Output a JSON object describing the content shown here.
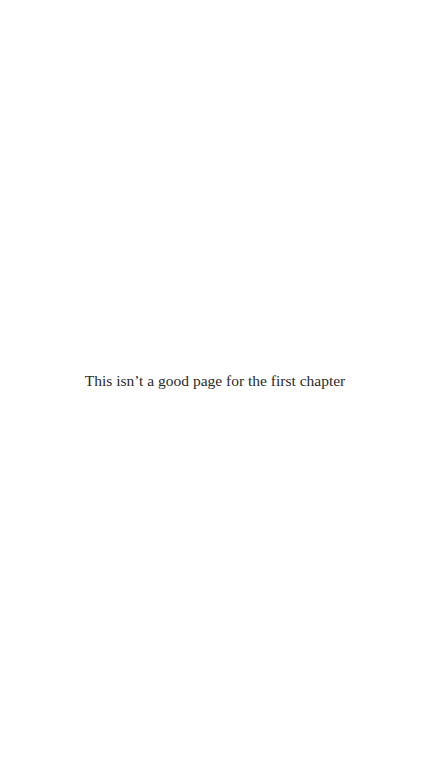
{
  "page": {
    "message": "This isn’t a good page for the first chapter"
  },
  "colors": {
    "background": "#ffffff",
    "text": "#2a2a2a"
  }
}
